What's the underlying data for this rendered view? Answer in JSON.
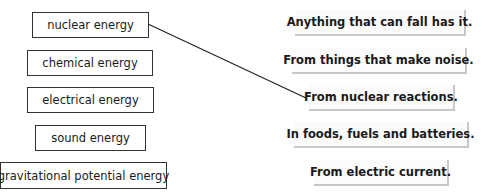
{
  "terms": [
    {
      "label": "nuclear energy"
    },
    {
      "label": "chemical energy"
    },
    {
      "label": "electrical energy"
    },
    {
      "label": "sound energy"
    },
    {
      "label": "gravitational potential energy"
    }
  ],
  "definitions": [
    {
      "label": "Anything that can fall has it."
    },
    {
      "label": "From things that make noise."
    },
    {
      "label": "From nuclear reactions."
    },
    {
      "label": "In foods, fuels and batteries."
    },
    {
      "label": "From electric current."
    }
  ],
  "connections": [
    {
      "from_term": "nuclear energy",
      "to_definition": "From nuclear reactions.",
      "color": "#222222"
    }
  ]
}
